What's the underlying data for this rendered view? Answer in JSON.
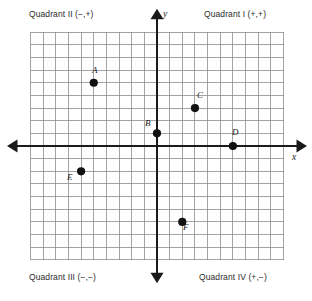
{
  "diagram": {
    "quadrant_labels": {
      "q1": "Quadrant I (+,+)",
      "q2": "Quadrant II (−,+)",
      "q3": "Quadrant III (−,−)",
      "q4": "Quadrant IV (+,−)"
    },
    "axis_labels": {
      "x": "x",
      "y": "y"
    },
    "colors": {
      "grid": "#8c8c8c",
      "axis": "#1a1a1a",
      "point": "#111111",
      "background": "#ffffff",
      "text": "#2a2a2a"
    }
  },
  "chart_data": {
    "type": "scatter",
    "xlabel": "x",
    "ylabel": "y",
    "xlim": [
      -10,
      10
    ],
    "ylim": [
      -9,
      9
    ],
    "grid": true,
    "grid_step": 1,
    "legend": "none",
    "origin": [
      0,
      0
    ],
    "points": [
      {
        "label": "A",
        "x": -5,
        "y": 5,
        "label_pos": "above"
      },
      {
        "label": "B",
        "x": 0,
        "y": 1,
        "label_pos": "above-left"
      },
      {
        "label": "C",
        "x": 3,
        "y": 3,
        "label_pos": "above"
      },
      {
        "label": "D",
        "x": 6,
        "y": 0,
        "label_pos": "above"
      },
      {
        "label": "E",
        "x": -6,
        "y": -2,
        "label_pos": "below-left"
      },
      {
        "label": "F",
        "x": 2,
        "y": -6,
        "label_pos": "below-right"
      }
    ],
    "annotations": [
      "Quadrant I (+,+)",
      "Quadrant II (−,+)",
      "Quadrant III (−,−)",
      "Quadrant IV (+,−)"
    ]
  }
}
